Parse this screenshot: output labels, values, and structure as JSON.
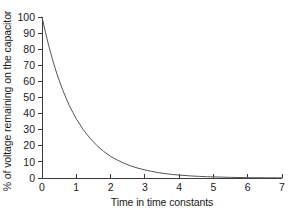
{
  "chart_data": {
    "type": "line",
    "title": "",
    "subtitle": "",
    "xlabel": "Time in time constants",
    "ylabel": "% of voltage remaining on the capacitor",
    "xlim": [
      0,
      7
    ],
    "ylim": [
      0,
      100
    ],
    "xticks": [
      0,
      1,
      2,
      3,
      4,
      5,
      6,
      7
    ],
    "yticks": [
      0,
      10,
      20,
      30,
      40,
      50,
      60,
      70,
      80,
      90,
      100
    ],
    "xtick_labels": [
      "0",
      "1",
      "2",
      "3",
      "4",
      "5",
      "6",
      "7"
    ],
    "ytick_labels": [
      "0",
      "10",
      "20",
      "30",
      "40",
      "50",
      "60",
      "70",
      "80",
      "90",
      "100"
    ],
    "grid": false,
    "legend": null,
    "legend_position": "none",
    "annotations": [],
    "series": [
      {
        "name": "Capacitor discharge",
        "formula": "V = 100 * exp(-t)",
        "color": "#555555",
        "line_width": 1,
        "x": [
          0,
          0.1,
          0.2,
          0.3,
          0.4,
          0.5,
          0.6,
          0.7,
          0.8,
          0.9,
          1.0,
          1.2,
          1.4,
          1.6,
          1.8,
          2.0,
          2.2,
          2.4,
          2.6,
          2.8,
          3.0,
          3.2,
          3.4,
          3.6,
          3.8,
          4.0,
          4.2,
          4.4,
          4.6,
          4.8,
          5.0,
          5.5,
          6.0,
          6.5,
          7.0
        ],
        "values": [
          100.0,
          90.5,
          81.9,
          74.1,
          67.0,
          60.7,
          54.9,
          49.7,
          44.9,
          40.7,
          36.8,
          30.1,
          24.7,
          20.2,
          16.5,
          13.5,
          11.1,
          9.1,
          7.4,
          6.1,
          5.0,
          4.1,
          3.3,
          2.7,
          2.2,
          1.8,
          1.5,
          1.2,
          1.0,
          0.8,
          0.7,
          0.4,
          0.2,
          0.15,
          0.1
        ]
      }
    ]
  },
  "axes": {
    "axis_color": "#3a3a3a",
    "background": "#ffffff"
  }
}
